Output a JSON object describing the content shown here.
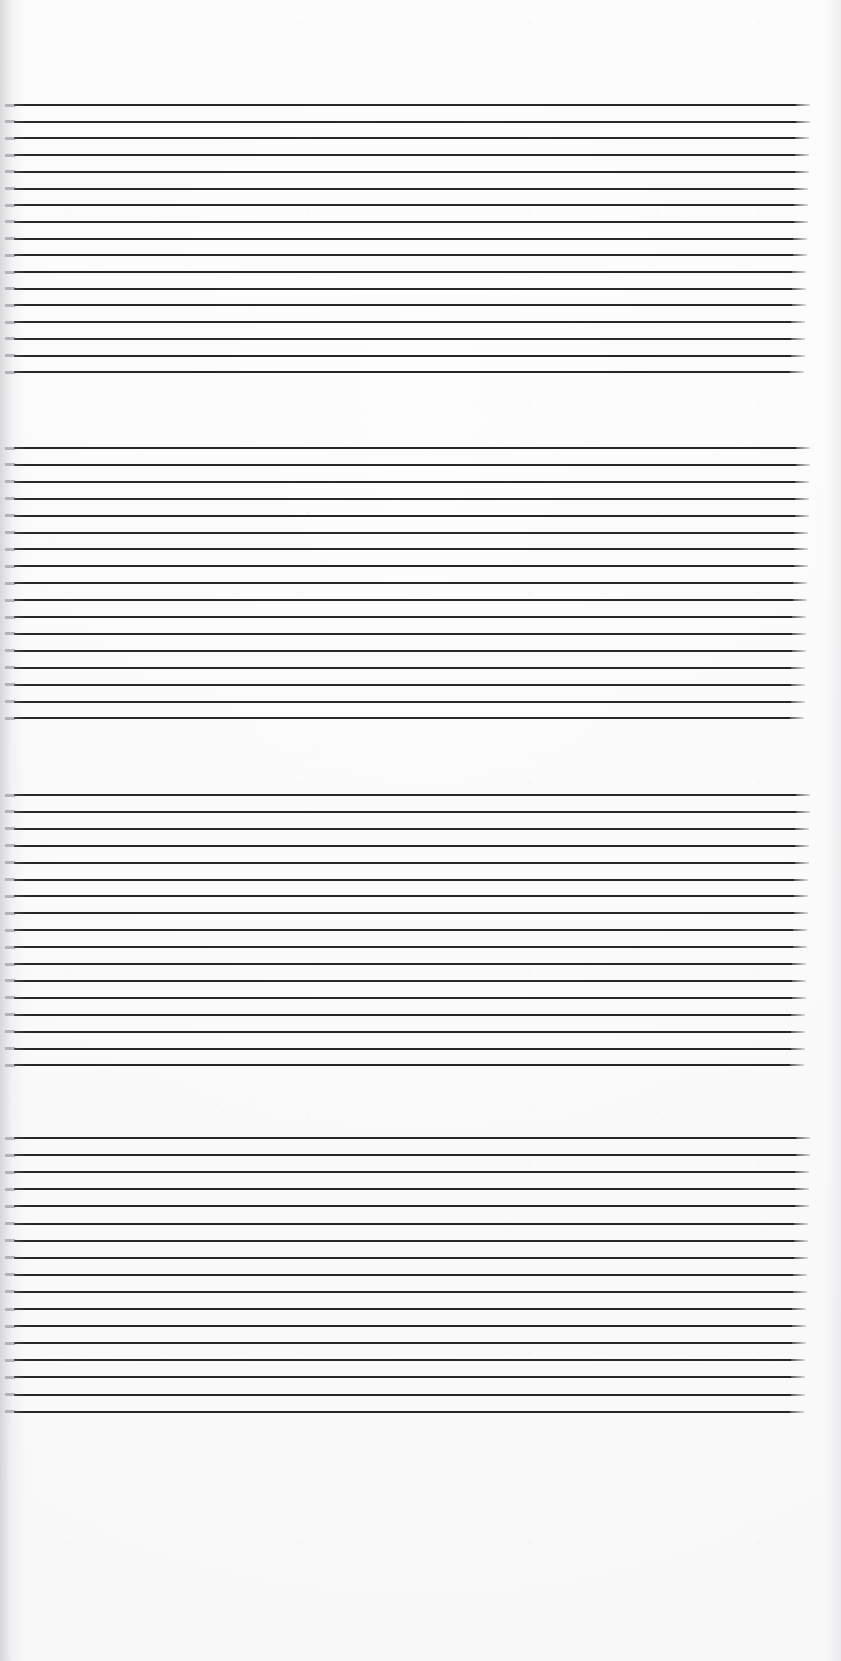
{
  "document": {
    "kind": "scanned-ruled-paper",
    "page_width": 841,
    "page_height": 1661,
    "paper_color": "#fdfdfd",
    "rule_color": "#26262b",
    "has_text": false,
    "caption": ""
  },
  "layout": {
    "blocks": [
      {
        "id": "block-1",
        "label": "Ruled line block 1",
        "top": 104,
        "left": 14,
        "width": 782,
        "line_count": 17,
        "line_spacing": 16.7,
        "line_thickness": 2
      },
      {
        "id": "block-2",
        "label": "Ruled line block 2",
        "top": 447,
        "left": 14,
        "width": 782,
        "line_count": 17,
        "line_spacing": 16.9,
        "line_thickness": 2
      },
      {
        "id": "block-3",
        "label": "Ruled line block 3",
        "top": 794,
        "left": 14,
        "width": 782,
        "line_count": 17,
        "line_spacing": 16.9,
        "line_thickness": 2
      },
      {
        "id": "block-4",
        "label": "Ruled line block 4",
        "top": 1137,
        "left": 14,
        "width": 782,
        "line_count": 17,
        "line_spacing": 17.1,
        "line_thickness": 2
      }
    ],
    "margins": {
      "top_blank": 104,
      "bottom_blank": 250,
      "left": 14,
      "right": 45
    }
  }
}
